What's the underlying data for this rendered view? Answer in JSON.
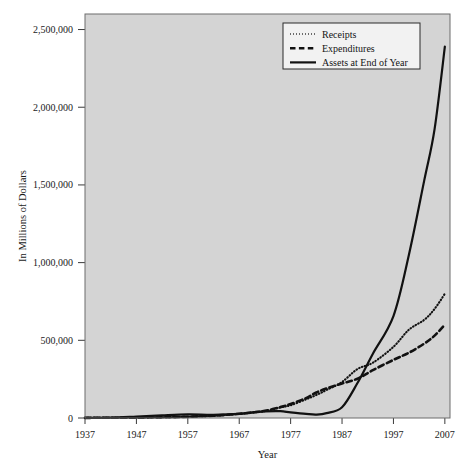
{
  "chart_data": {
    "type": "line",
    "title": "",
    "xlabel": "Year",
    "ylabel": "In Millions of Dollars",
    "xlim": [
      1937,
      2008
    ],
    "ylim": [
      0,
      2600000
    ],
    "grid": false,
    "legend_position": "top-right",
    "xticks": [
      1937,
      1947,
      1957,
      1967,
      1977,
      1987,
      1997,
      2007
    ],
    "xtick_labels": [
      "1937",
      "1947",
      "1957",
      "1967",
      "1977",
      "1987",
      "1997",
      "2007"
    ],
    "yticks": [
      0,
      500000,
      1000000,
      1500000,
      2000000,
      2500000
    ],
    "ytick_labels": [
      "0",
      "500,000",
      "1,000,000",
      "1,500,000",
      "2,000,000",
      "2,500,000"
    ],
    "x": [
      1937,
      1942,
      1947,
      1952,
      1957,
      1962,
      1967,
      1970,
      1972,
      1975,
      1977,
      1980,
      1982,
      1984,
      1987,
      1990,
      1993,
      1997,
      2000,
      2003,
      2005,
      2007
    ],
    "series": [
      {
        "name": "Receipts",
        "style": "dotted",
        "color": "#111111",
        "values": [
          1000,
          1500,
          2000,
          4000,
          8000,
          14000,
          26000,
          36000,
          44000,
          68000,
          82000,
          120000,
          148000,
          180000,
          232000,
          315000,
          356000,
          458000,
          568000,
          632000,
          702000,
          800000
        ]
      },
      {
        "name": "Expenditures",
        "style": "dashed",
        "color": "#111111",
        "values": [
          1000,
          1500,
          2000,
          4000,
          8000,
          15000,
          27000,
          37000,
          46000,
          70000,
          90000,
          128000,
          164000,
          190000,
          222000,
          253000,
          308000,
          374000,
          420000,
          479000,
          530000,
          600000
        ]
      },
      {
        "name": "Assets at End of Year",
        "style": "solid",
        "color": "#111111",
        "values": [
          1000,
          2000,
          9000,
          17000,
          23000,
          21000,
          27000,
          38000,
          43000,
          44000,
          36000,
          26000,
          22000,
          31000,
          69000,
          225000,
          414000,
          656000,
          1049000,
          1531000,
          1859000,
          2390000
        ]
      }
    ]
  },
  "legend": {
    "entries": [
      {
        "label": "Receipts",
        "style": "dotted"
      },
      {
        "label": "Expenditures",
        "style": "dashed"
      },
      {
        "label": "Assets at End of Year",
        "style": "solid"
      }
    ]
  }
}
